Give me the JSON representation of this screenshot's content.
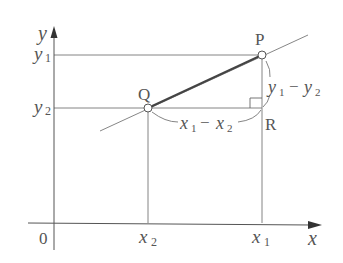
{
  "diagram": {
    "type": "coordinate-geometry",
    "axes": {
      "x_label": "x",
      "y_label": "y",
      "origin_label": "0"
    },
    "ticks": {
      "x": [
        {
          "main": "x",
          "sub": "2"
        },
        {
          "main": "x",
          "sub": "1"
        }
      ],
      "y": [
        {
          "main": "y",
          "sub": "1"
        },
        {
          "main": "y",
          "sub": "2"
        }
      ]
    },
    "points": {
      "P": {
        "label": "P"
      },
      "Q": {
        "label": "Q"
      },
      "R": {
        "label": "R"
      }
    },
    "annotations": {
      "horizontal_diff": {
        "a": "x",
        "a_sub": "1",
        "op": "−",
        "b": "x",
        "b_sub": "2"
      },
      "vertical_diff": {
        "a": "y",
        "a_sub": "1",
        "op": "−",
        "b": "y",
        "b_sub": "2"
      }
    },
    "colors": {
      "line": "#666666",
      "segment": "#444444",
      "text": "#555555",
      "background": "#ffffff"
    }
  }
}
